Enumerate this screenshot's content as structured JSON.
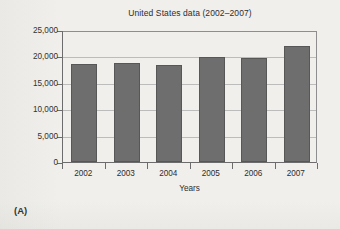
{
  "figure": {
    "panel_label": "(A)",
    "background_color": "#f0efec"
  },
  "chart_data": {
    "type": "bar",
    "title": "United States data (2002–2007)",
    "xlabel": "Years",
    "ylabel": "",
    "categories": [
      "2002",
      "2003",
      "2004",
      "2005",
      "2006",
      "2007"
    ],
    "values": [
      18600,
      18800,
      18400,
      19950,
      19700,
      22000
    ],
    "ylim": [
      0,
      25000
    ],
    "ytick_labels": [
      "0",
      "5,000",
      "10,000",
      "15,000",
      "20,000",
      "25,000"
    ],
    "ytick_values": [
      0,
      5000,
      10000,
      15000,
      20000,
      25000
    ],
    "grid": true,
    "legend": false,
    "bar_color": "#6e6e6e",
    "bar_edge_color": "#575757",
    "axis_color": "#6c6c6c",
    "gridline_color": "#bcbcbc"
  }
}
